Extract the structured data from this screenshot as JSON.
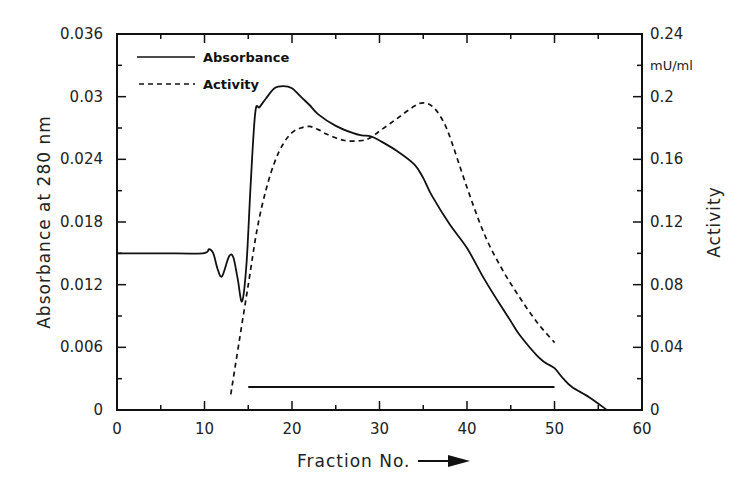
{
  "chart_data": {
    "type": "line",
    "title": "",
    "xlabel": "Fraction No.",
    "xlabel_arrow": "→",
    "ylabel": "Absorbance at 280 nm",
    "ylabel_right": "Activity",
    "ylabel_right_unit": "mU/ml",
    "xlim": [
      0,
      60
    ],
    "ylim": [
      0,
      0.036
    ],
    "ylim_right": [
      0,
      0.24
    ],
    "x_ticks": [
      "0",
      "10",
      "20",
      "30",
      "40",
      "50",
      "60"
    ],
    "y_ticks": [
      "0",
      "0.006",
      "0.012",
      "0.018",
      "0.024",
      "0.03",
      "0.036"
    ],
    "y_ticks_right": [
      "0",
      "0.04",
      "0.08",
      "0.12",
      "0.16",
      "0.2",
      "0.24"
    ],
    "grid": false,
    "legend_position": "upper left",
    "series": [
      {
        "name": "Absorbance",
        "axis": "left",
        "style": "solid",
        "x": [
          0,
          5,
          9.8,
          10.5,
          11,
          11.5,
          12,
          12.8,
          13.3,
          13.8,
          14.3,
          14.8,
          15.3,
          15.8,
          16.3,
          17,
          18,
          19,
          20,
          21,
          22,
          23,
          25,
          27,
          28,
          29,
          30,
          32,
          34,
          35,
          36,
          38,
          40,
          42,
          44,
          45,
          46,
          48,
          49,
          50,
          51,
          52,
          54,
          56
        ],
        "values": [
          0.015,
          0.015,
          0.015,
          0.0154,
          0.015,
          0.0135,
          0.0128,
          0.0147,
          0.0146,
          0.0125,
          0.0104,
          0.014,
          0.022,
          0.0285,
          0.029,
          0.0298,
          0.0308,
          0.031,
          0.0308,
          0.03,
          0.0292,
          0.0283,
          0.0272,
          0.0265,
          0.0263,
          0.0262,
          0.0258,
          0.0248,
          0.0235,
          0.0222,
          0.0205,
          0.0178,
          0.0155,
          0.0125,
          0.0098,
          0.0085,
          0.0072,
          0.0052,
          0.0045,
          0.004,
          0.003,
          0.0022,
          0.0012,
          0.0
        ]
      },
      {
        "name": "Activity",
        "axis": "right",
        "style": "dashed",
        "x": [
          13,
          14,
          15,
          16,
          17,
          18,
          19,
          20,
          21,
          22,
          23,
          24,
          26,
          28,
          29,
          30,
          32,
          34,
          35,
          36,
          37,
          38,
          40,
          42,
          44,
          46,
          48,
          50
        ],
        "values": [
          0.01,
          0.045,
          0.08,
          0.115,
          0.14,
          0.158,
          0.17,
          0.177,
          0.18,
          0.181,
          0.179,
          0.176,
          0.172,
          0.172,
          0.174,
          0.178,
          0.186,
          0.194,
          0.196,
          0.194,
          0.187,
          0.175,
          0.142,
          0.112,
          0.09,
          0.072,
          0.056,
          0.043
        ]
      }
    ],
    "annotations": [
      {
        "type": "horizontal-bar",
        "label": "pooled fractions",
        "x_start": 15,
        "x_end": 50,
        "y": 0.0022,
        "axis": "left"
      }
    ]
  },
  "legend": {
    "items": [
      {
        "label": "Absorbance",
        "style": "solid"
      },
      {
        "label": "Activity",
        "style": "dashed"
      }
    ]
  },
  "colors": {
    "line": "#111111",
    "axis": "#111111",
    "background": "#ffffff"
  }
}
